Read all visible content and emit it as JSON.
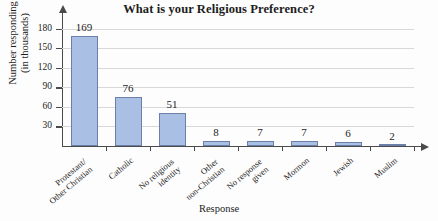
{
  "chart_data": {
    "type": "bar",
    "title": "What is your Religious Preference?",
    "xlabel": "Response",
    "ylabel_line1": "Number responding",
    "ylabel_line2": "(in thousands)",
    "categories": [
      "Protestant/\nOther Christian",
      "Catholic",
      "No religious\nidentity",
      "Other\nnon-Christian",
      "No response\ngiven",
      "Mormon",
      "Jewish",
      "Muslim"
    ],
    "category_lines": [
      [
        "Protestant/",
        "Other Christian"
      ],
      [
        "Catholic"
      ],
      [
        "No religious",
        "identity"
      ],
      [
        "Other",
        "non-Christian"
      ],
      [
        "No response",
        "given"
      ],
      [
        "Mormon"
      ],
      [
        "Jewish"
      ],
      [
        "Muslim"
      ]
    ],
    "values": [
      169,
      76,
      51,
      8,
      7,
      7,
      6,
      2
    ],
    "value_labels": [
      "169",
      "76",
      "51",
      "8",
      "7",
      "7",
      "6",
      "2"
    ],
    "yticks": [
      30,
      60,
      90,
      120,
      150,
      180
    ],
    "ytick_labels": [
      "30",
      "60",
      "90",
      "120",
      "150",
      "180"
    ],
    "ylim": [
      0,
      195
    ],
    "grid": true,
    "legend": "none",
    "bar_fill_color": "#a9c0e4",
    "bar_border_color": "#6b7fa8",
    "axis_color": "#4a4a4a",
    "gridline_color": "#d8d8d8",
    "background_color": "#fdfdfd"
  }
}
